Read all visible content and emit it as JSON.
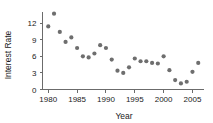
{
  "chart_data": {
    "type": "scatter",
    "title": "",
    "xlabel": "Year",
    "ylabel": "Interest Rate",
    "xlim": [
      1979,
      2007
    ],
    "ylim": [
      0,
      14
    ],
    "grid": false,
    "legend": null,
    "marker_color": "#6e6e6e",
    "axis_color": "#6b6b6b",
    "xticks": [
      1980,
      1985,
      1990,
      1995,
      2000,
      2005
    ],
    "xtick_labels": [
      "1980",
      "1985",
      "1990",
      "1995",
      "2000",
      "2005"
    ],
    "yticks": [
      0,
      3,
      6,
      9,
      12
    ],
    "ytick_labels": [
      "0",
      "3",
      "6",
      "9",
      "12"
    ],
    "x": [
      1980,
      1981,
      1982,
      1983,
      1984,
      1985,
      1986,
      1987,
      1988,
      1989,
      1990,
      1991,
      1992,
      1993,
      1994,
      1995,
      1996,
      1997,
      1998,
      1999,
      2000,
      2001,
      2002,
      2003,
      2004,
      2005,
      2006
    ],
    "y": [
      11.4,
      13.7,
      10.4,
      8.6,
      9.4,
      7.5,
      6.0,
      5.8,
      6.5,
      8.0,
      7.5,
      5.4,
      3.4,
      3.0,
      4.0,
      5.6,
      5.1,
      5.1,
      4.8,
      4.7,
      6.0,
      3.5,
      1.7,
      1.1,
      1.4,
      3.2,
      4.8
    ],
    "points": [
      {
        "year": 1980,
        "rate": 11.4
      },
      {
        "year": 1981,
        "rate": 13.7
      },
      {
        "year": 1982,
        "rate": 10.4
      },
      {
        "year": 1983,
        "rate": 8.6
      },
      {
        "year": 1984,
        "rate": 9.4
      },
      {
        "year": 1985,
        "rate": 7.5
      },
      {
        "year": 1986,
        "rate": 6.0
      },
      {
        "year": 1987,
        "rate": 5.8
      },
      {
        "year": 1988,
        "rate": 6.5
      },
      {
        "year": 1989,
        "rate": 8.0
      },
      {
        "year": 1990,
        "rate": 7.5
      },
      {
        "year": 1991,
        "rate": 5.4
      },
      {
        "year": 1992,
        "rate": 3.4
      },
      {
        "year": 1993,
        "rate": 3.0
      },
      {
        "year": 1994,
        "rate": 4.0
      },
      {
        "year": 1995,
        "rate": 5.6
      },
      {
        "year": 1996,
        "rate": 5.1
      },
      {
        "year": 1997,
        "rate": 5.1
      },
      {
        "year": 1998,
        "rate": 4.8
      },
      {
        "year": 1999,
        "rate": 4.7
      },
      {
        "year": 2000,
        "rate": 6.0
      },
      {
        "year": 2001,
        "rate": 3.5
      },
      {
        "year": 2002,
        "rate": 1.7
      },
      {
        "year": 2003,
        "rate": 1.1
      },
      {
        "year": 2004,
        "rate": 1.4
      },
      {
        "year": 2005,
        "rate": 3.2
      },
      {
        "year": 2006,
        "rate": 4.8
      }
    ]
  }
}
